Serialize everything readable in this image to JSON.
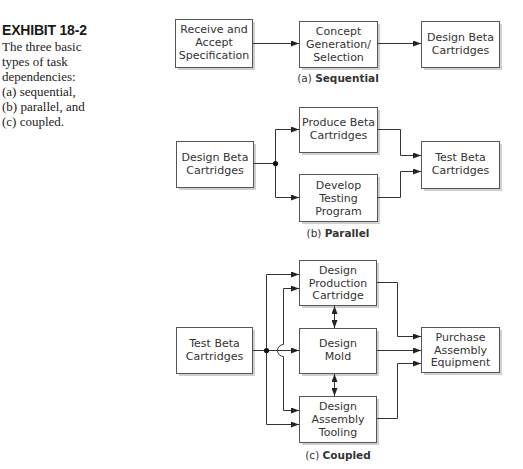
{
  "caption": {
    "title": "EXHIBIT 18-2",
    "lines": [
      "The three basic",
      "types of task",
      "dependencies:",
      "(a) sequential,",
      "(b) parallel, and",
      "(c) coupled."
    ]
  },
  "sequential": {
    "label_prefix": "(a) ",
    "label_bold": "Sequential",
    "boxes": [
      {
        "lines": [
          "Receive and",
          "Accept",
          "Specification"
        ]
      },
      {
        "lines": [
          "Concept",
          "Generation/",
          "Selection"
        ]
      },
      {
        "lines": [
          "Design Beta",
          "Cartridges"
        ]
      }
    ]
  },
  "parallel": {
    "label_prefix": "(b) ",
    "label_bold": "Parallel",
    "boxes": [
      {
        "lines": [
          "Design Beta",
          "Cartridges"
        ]
      },
      {
        "lines": [
          "Produce Beta",
          "Cartridges"
        ]
      },
      {
        "lines": [
          "Develop",
          "Testing",
          "Program"
        ]
      },
      {
        "lines": [
          "Test Beta",
          "Cartridges"
        ]
      }
    ]
  },
  "coupled": {
    "label_prefix": "(c) ",
    "label_bold": "Coupled",
    "boxes": [
      {
        "lines": [
          "Test Beta",
          "Cartridges"
        ]
      },
      {
        "lines": [
          "Design",
          "Production",
          "Cartridge"
        ]
      },
      {
        "lines": [
          "Design",
          "Mold"
        ]
      },
      {
        "lines": [
          "Design",
          "Assembly",
          "Tooling"
        ]
      },
      {
        "lines": [
          "Purchase",
          "Assembly",
          "Equipment"
        ]
      }
    ]
  }
}
